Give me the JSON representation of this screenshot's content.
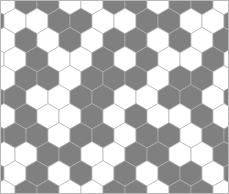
{
  "figure": {
    "name": "hexagonal-tiling-pattern",
    "type": "hex-grid-pattern",
    "width": 229,
    "height": 194,
    "background_color": "#ffffff",
    "border_color": "#b8b8b8"
  },
  "palette": {
    "fill_on": "#808080",
    "fill_off": "#ffffff",
    "stroke": "#b0b0b0",
    "stroke_width": 0.7
  },
  "geometry": {
    "orientation": "pointy-top",
    "hex_width": 22.0,
    "hex_height": 25.4,
    "row_step": 19.05,
    "col_step": 22.0,
    "row_offset": 11.0,
    "origin_x": 4.0,
    "origin_y": 2.0,
    "rows": 11,
    "cols": 11
  },
  "chart_data": {
    "type": "heatmap",
    "title": "",
    "xlabel": "",
    "ylabel": "",
    "legend": [],
    "grid": false,
    "colormap": [
      "#ffffff",
      "#808080"
    ],
    "rows": 11,
    "cols": 11,
    "values": [
      [
        0,
        1,
        1,
        0,
        0,
        1,
        1,
        0,
        1,
        1,
        0
      ],
      [
        0,
        0,
        1,
        1,
        0,
        0,
        1,
        1,
        0,
        0,
        1
      ],
      [
        0,
        1,
        0,
        1,
        0,
        1,
        1,
        0,
        1,
        0,
        1
      ],
      [
        0,
        1,
        0,
        0,
        1,
        0,
        1,
        0,
        0,
        1,
        0
      ],
      [
        0,
        1,
        1,
        0,
        1,
        1,
        1,
        0,
        1,
        1,
        0
      ],
      [
        1,
        0,
        0,
        1,
        1,
        0,
        0,
        1,
        1,
        0,
        1
      ],
      [
        0,
        1,
        0,
        0,
        1,
        0,
        1,
        0,
        0,
        1,
        0
      ],
      [
        1,
        1,
        0,
        1,
        1,
        0,
        1,
        1,
        0,
        1,
        1
      ],
      [
        0,
        0,
        1,
        1,
        0,
        0,
        1,
        1,
        0,
        0,
        1
      ],
      [
        0,
        1,
        0,
        1,
        0,
        1,
        0,
        1,
        1,
        0,
        1
      ],
      [
        0,
        1,
        1,
        0,
        0,
        1,
        1,
        0,
        1,
        1,
        0
      ]
    ]
  }
}
